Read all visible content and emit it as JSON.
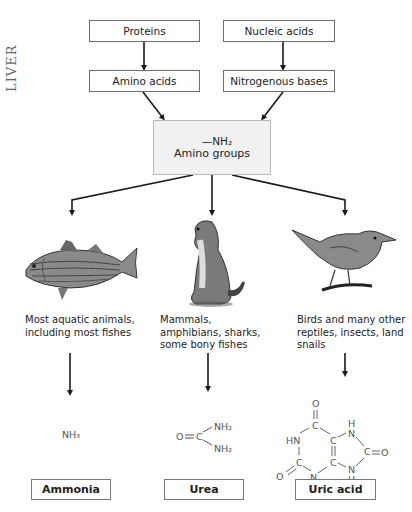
{
  "annotation": {
    "handwritten_note": "LIVER"
  },
  "sources": [
    {
      "label": "Proteins",
      "product": "Amino acids"
    },
    {
      "label": "Nucleic acids",
      "product": "Nitrogenous bases"
    }
  ],
  "central": {
    "formula": "—NH₂",
    "label": "Amino groups"
  },
  "branches": [
    {
      "animal": "fish",
      "caption": "Most aquatic animals, including most fishes",
      "waste_formula": "NH₃",
      "waste_name": "Ammonia"
    },
    {
      "animal": "ground-squirrel",
      "caption": "Mammals, amphibians, sharks, some bony fishes",
      "waste_formula": "O=C(NH₂)₂",
      "waste_name": "Urea"
    },
    {
      "animal": "bird",
      "caption": "Birds and many other reptiles, insects, land snails",
      "waste_formula": "uric acid structure",
      "waste_name": "Uric acid"
    }
  ],
  "chem": {
    "ammonia": "NH₃",
    "urea": {
      "o": "O",
      "c": "C",
      "nh2a": "NH₂",
      "nh2b": "NH₂"
    },
    "uric": {
      "o1": "O",
      "c1": "C",
      "hn": "HN",
      "c2": "C",
      "c3": "C",
      "n1": "N",
      "h1": "H",
      "c4": "C",
      "o2": "O",
      "c5": "C",
      "n2": "N",
      "h2": "H",
      "o3": "O",
      "c6": "C",
      "n3": "N",
      "h3": "H"
    }
  },
  "colors": {
    "line": "#1a1a1a",
    "box_border": "#6e6e6e",
    "center_fill": "#f1f1f1",
    "chem_text": "#555555"
  }
}
